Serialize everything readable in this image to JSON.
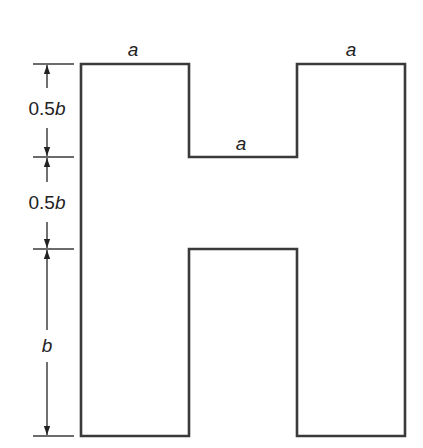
{
  "diagram": {
    "title": "",
    "shape": "H-shaped cross section",
    "top_labels": {
      "left_flange_width": "a",
      "web_gap_width": "a",
      "right_flange_width": "a"
    },
    "dimensions": [
      {
        "id": "top",
        "num": "0.5",
        "var": "b"
      },
      {
        "id": "middle",
        "num": "0.5",
        "var": "b"
      },
      {
        "id": "bottom",
        "num": "",
        "var": "b"
      }
    ],
    "colors": {
      "stroke": "#3a3a3a",
      "text": "#222222",
      "background": "#ffffff"
    }
  }
}
